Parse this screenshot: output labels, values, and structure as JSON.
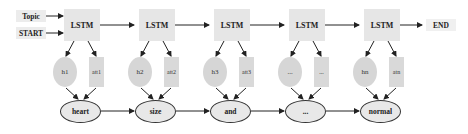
{
  "inputs": [
    {
      "label": "Topic"
    },
    {
      "label": "START"
    }
  ],
  "output": {
    "label": "END"
  },
  "lstm_cells": [
    {
      "label": "LSTM"
    },
    {
      "label": "LSTM"
    },
    {
      "label": "LSTM"
    },
    {
      "label": "LSTM"
    },
    {
      "label": "LSTM"
    }
  ],
  "hidden_states": [
    {
      "label": "h1"
    },
    {
      "label": "h2"
    },
    {
      "label": "h3"
    },
    {
      "label": "..."
    },
    {
      "label": "hn"
    }
  ],
  "attention": [
    {
      "label": "att1"
    },
    {
      "label": "att2"
    },
    {
      "label": "att3"
    },
    {
      "label": "..."
    },
    {
      "label": "atn"
    }
  ],
  "words": [
    {
      "label": "heart"
    },
    {
      "label": "size"
    },
    {
      "label": "and"
    },
    {
      "label": "..."
    },
    {
      "label": "normal"
    }
  ],
  "colors": {
    "lstm_fill": "#e6e6e6",
    "hidden_fill": "#d6d6d6",
    "att_fill": "#d9d9d9",
    "word_fill": "#e8e8e8",
    "arrow": "#222222"
  }
}
